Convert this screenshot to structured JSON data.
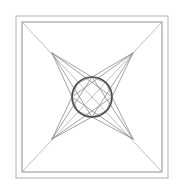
{
  "document": {
    "title": "Geometric Line Drawing",
    "kind": "line-art-figure",
    "description": "Nested square frames with corner-to-center diagonals, a four-pointed concave star, an inscribed circle and an octagon."
  },
  "canvas": {
    "width": 184,
    "height": 194,
    "background_color": "#ffffff"
  },
  "palette": {
    "frame_outer_color": "#b8b8b8",
    "frame_inner_color": "#8e8e8e",
    "diagonal_color": "#b0b0b0",
    "star_color": "#8a8a8a",
    "circle_color": "#4a4a4a",
    "octagon_color": "#9a9a9a"
  },
  "strokes": {
    "frame_outer_width": 1.1,
    "frame_inner_width": 1.0,
    "diagonal_width": 0.8,
    "star_width": 0.8,
    "circle_width": 1.6,
    "octagon_width": 0.8
  },
  "geometry": {
    "frame_outer": {
      "x": 16,
      "y": 16,
      "width": 152,
      "height": 162
    },
    "frame_inner": {
      "x": 22,
      "y": 22,
      "width": 140,
      "height": 150
    },
    "frame_corner_marks": [
      {
        "name": "top-left",
        "x": 22,
        "y": 22
      },
      {
        "name": "top-right",
        "x": 162,
        "y": 22
      },
      {
        "name": "bottom-left",
        "x": 22,
        "y": 172
      },
      {
        "name": "bottom-right",
        "x": 162,
        "y": 172
      }
    ],
    "center": {
      "x": 92,
      "y": 97
    },
    "circle": {
      "cx": 92,
      "cy": 97,
      "r": 20
    },
    "star_tips": [
      {
        "name": "top-left-tip",
        "x": 52,
        "y": 53
      },
      {
        "name": "top-right-tip",
        "x": 133,
        "y": 53
      },
      {
        "name": "bottom-right-tip",
        "x": 133,
        "y": 139
      },
      {
        "name": "bottom-left-tip",
        "x": 52,
        "y": 139
      }
    ],
    "star_inner_points": [
      {
        "name": "star-north",
        "x": 92,
        "y": 77
      },
      {
        "name": "star-east",
        "x": 112,
        "y": 97
      },
      {
        "name": "star-south",
        "x": 92,
        "y": 117
      },
      {
        "name": "star-west",
        "x": 72,
        "y": 97
      }
    ],
    "diagonal_lines": [
      {
        "name": "diagonal-tl-br",
        "x1": 22,
        "y1": 22,
        "x2": 162,
        "y2": 172
      },
      {
        "name": "diagonal-tr-bl",
        "x1": 162,
        "y1": 22,
        "x2": 22,
        "y2": 172
      }
    ],
    "octagon_vertices": [
      {
        "x": 92,
        "y": 77
      },
      {
        "x": 106.1,
        "y": 82.9
      },
      {
        "x": 112,
        "y": 97
      },
      {
        "x": 106.1,
        "y": 111.1
      },
      {
        "x": 92,
        "y": 117
      },
      {
        "x": 77.9,
        "y": 111.1
      },
      {
        "x": 72,
        "y": 97
      },
      {
        "x": 77.9,
        "y": 82.9
      }
    ],
    "star_fan_lines": [
      {
        "name": "fan-tl-to-north",
        "x1": 52,
        "y1": 53,
        "x2": 92,
        "y2": 77
      },
      {
        "name": "fan-tl-to-west",
        "x1": 52,
        "y1": 53,
        "x2": 72,
        "y2": 97
      },
      {
        "name": "fan-tr-to-north",
        "x1": 133,
        "y1": 53,
        "x2": 92,
        "y2": 77
      },
      {
        "name": "fan-tr-to-east",
        "x1": 133,
        "y1": 53,
        "x2": 112,
        "y2": 97
      },
      {
        "name": "fan-br-to-south",
        "x1": 133,
        "y1": 139,
        "x2": 92,
        "y2": 117
      },
      {
        "name": "fan-br-to-east",
        "x1": 133,
        "y1": 139,
        "x2": 112,
        "y2": 97
      },
      {
        "name": "fan-bl-to-south",
        "x1": 52,
        "y1": 139,
        "x2": 92,
        "y2": 117
      },
      {
        "name": "fan-bl-to-west",
        "x1": 52,
        "y1": 139,
        "x2": 72,
        "y2": 97
      }
    ],
    "cross_chords": [
      {
        "name": "chord-tl-to-south",
        "x1": 52,
        "y1": 53,
        "x2": 92,
        "y2": 117
      },
      {
        "name": "chord-tl-to-east",
        "x1": 52,
        "y1": 53,
        "x2": 112,
        "y2": 97
      },
      {
        "name": "chord-tr-to-south",
        "x1": 133,
        "y1": 53,
        "x2": 92,
        "y2": 117
      },
      {
        "name": "chord-tr-to-west",
        "x1": 133,
        "y1": 53,
        "x2": 72,
        "y2": 97
      },
      {
        "name": "chord-br-to-north",
        "x1": 133,
        "y1": 139,
        "x2": 92,
        "y2": 77
      },
      {
        "name": "chord-br-to-west",
        "x1": 133,
        "y1": 139,
        "x2": 72,
        "y2": 97
      },
      {
        "name": "chord-bl-to-north",
        "x1": 52,
        "y1": 139,
        "x2": 92,
        "y2": 77
      },
      {
        "name": "chord-bl-to-east",
        "x1": 52,
        "y1": 139,
        "x2": 112,
        "y2": 97
      }
    ]
  }
}
